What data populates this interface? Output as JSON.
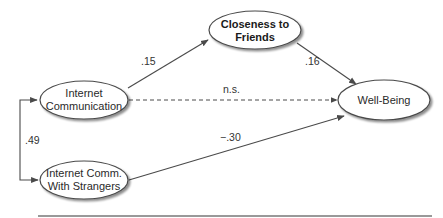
{
  "diagram": {
    "type": "path-model",
    "colors": {
      "stroke": "#4a4a4a",
      "text": "#2a2a2a",
      "shadow": "#9a9a9a",
      "rule": "#777777"
    },
    "nodes": {
      "closeness": {
        "label_lines": [
          "Closeness to",
          "Friends"
        ],
        "bold": true
      },
      "internet_comm": {
        "label_lines": [
          "Internet",
          "Communication"
        ],
        "bold": false
      },
      "strangers": {
        "label_lines": [
          "Internet Comm.",
          "With Strangers"
        ],
        "bold": false
      },
      "well_being": {
        "label_lines": [
          "Well-Being"
        ],
        "bold": false
      }
    },
    "edges": [
      {
        "from": "internet_comm",
        "to": "closeness",
        "label": ".15",
        "style": "solid"
      },
      {
        "from": "closeness",
        "to": "well_being",
        "label": ".16",
        "style": "solid"
      },
      {
        "from": "internet_comm",
        "to": "well_being",
        "label": "n.s.",
        "style": "dashed"
      },
      {
        "from": "strangers",
        "to": "well_being",
        "label": "−.30",
        "style": "solid"
      },
      {
        "from": "internet_comm",
        "to": "strangers",
        "label": ".49",
        "style": "correlation"
      }
    ]
  }
}
